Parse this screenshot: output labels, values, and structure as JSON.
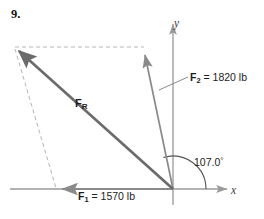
{
  "figure": {
    "problem_number": "9.",
    "axes": {
      "x_label": "x",
      "y_label": "y",
      "origin": [
        173,
        189
      ],
      "x_axis_from": [
        10,
        189
      ],
      "x_axis_to": [
        229,
        189
      ],
      "y_axis_from": [
        173,
        22
      ],
      "y_axis_to": [
        173,
        205
      ]
    },
    "colors": {
      "resultant": "#6b6b6b",
      "component": "#8a8a8a",
      "axis": "#9a9a9a",
      "dashed": "#b5b5b5",
      "arc": "#555555",
      "text": "#1c1c1c"
    },
    "vectors": [
      {
        "name": "F_1",
        "label_symbol": "F",
        "label_subscript": "1",
        "label_value": "= 1570 lb",
        "label_full": "F1 = 1570 lb",
        "magnitude": 1570,
        "unit": "lb",
        "direction_deg": 180,
        "tail": [
          173,
          189
        ],
        "tip": [
          57,
          189
        ]
      },
      {
        "name": "F_2",
        "label_symbol": "F",
        "label_subscript": "2",
        "label_value": "= 1820 lb",
        "label_full": "F2 = 1820 lb",
        "magnitude": 1820,
        "unit": "lb",
        "direction_deg": 107.0,
        "tail": [
          173,
          189
        ],
        "tip": [
          143,
          48
        ]
      },
      {
        "name": "F_R",
        "label_symbol": "F",
        "label_subscript": "R",
        "label_value": "",
        "label_full": "FR",
        "magnitude": null,
        "unit": "",
        "tail": [
          173,
          189
        ],
        "tip": [
          14,
          48
        ]
      }
    ],
    "angle": {
      "value": "107.0",
      "degree_symbol": "°",
      "label_full": "107.0°",
      "measured_from": "positive x-axis",
      "measured_to": "F_2",
      "arc_radius": 33
    },
    "construction_lines": [
      {
        "name": "parallelogram-top-dashed",
        "from": [
          14,
          47
        ],
        "to": [
          143,
          47
        ],
        "style": "dashed"
      },
      {
        "name": "parallelogram-left-dashed",
        "from": [
          14,
          48
        ],
        "to": [
          55,
          189
        ],
        "style": "dashed"
      }
    ],
    "leader_lines": [
      {
        "name": "force-2-leader",
        "from": [
          188,
          77
        ],
        "to": [
          159,
          90
        ]
      }
    ]
  }
}
